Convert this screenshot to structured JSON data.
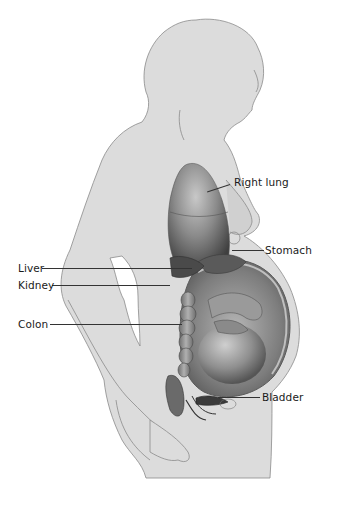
{
  "diagram": {
    "colors": {
      "background": "#ffffff",
      "skin": "#dcdcdc",
      "outline": "#8a8a8a",
      "organ_dark": "#4a4a4a",
      "organ_mid": "#8c8c8c",
      "organ_light": "#bdbdbd",
      "leader_line": "#333333",
      "label_text": "#1a1a1a"
    },
    "labels": [
      {
        "id": "right-lung",
        "text": "Right lung",
        "side": "right"
      },
      {
        "id": "stomach",
        "text": "Stomach",
        "side": "right"
      },
      {
        "id": "liver",
        "text": "Liver",
        "side": "left"
      },
      {
        "id": "kidney",
        "text": "Kidney",
        "side": "left"
      },
      {
        "id": "colon",
        "text": "Colon",
        "side": "left"
      },
      {
        "id": "bladder",
        "text": "Bladder",
        "side": "right"
      }
    ]
  }
}
